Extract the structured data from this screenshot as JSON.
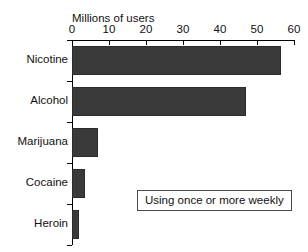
{
  "clipped_header": "",
  "annotation": {
    "text": "Using once or more weekly"
  },
  "chart_data": {
    "type": "bar",
    "orientation": "horizontal",
    "title": "",
    "xlabel": "Millions of users",
    "ylabel": "",
    "categories": [
      "Nicotine",
      "Alcohol",
      "Marijuana",
      "Cocaine",
      "Heroin"
    ],
    "values": [
      56.5,
      47,
      7,
      3.5,
      2
    ],
    "xlim": [
      0,
      60
    ],
    "xticks": [
      0,
      10,
      20,
      30,
      40,
      50,
      60
    ],
    "xtick_labels": [
      "0",
      "10",
      "20",
      "30",
      "40",
      "50",
      "60"
    ],
    "grid": false,
    "legend": null,
    "annotations": [
      "Using once or more weekly"
    ],
    "bar_color": "#3a3a3a",
    "axis_color": "#000000",
    "background": "#ffffff"
  }
}
